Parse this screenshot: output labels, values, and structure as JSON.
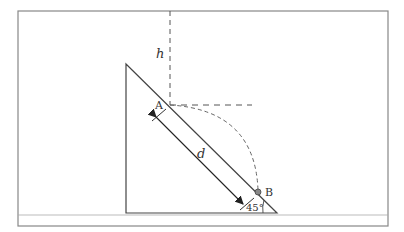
{
  "diagram": {
    "labels": {
      "height": "h",
      "point_a": "A",
      "point_b": "B",
      "distance": "d",
      "angle": "45°"
    },
    "colors": {
      "stroke": "#444444",
      "frame": "#888888",
      "dashed": "#555555",
      "ball": "#777777"
    }
  }
}
